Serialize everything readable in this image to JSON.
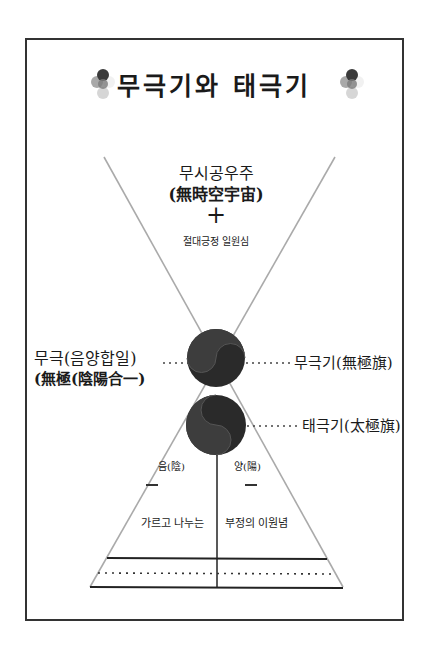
{
  "title": "무극기와 태극기",
  "title_icon": "flower-dots-icon",
  "top_block": {
    "line1": "무시공우주",
    "line2": "(無時空宇宙)",
    "plus": "+",
    "line3": "절대긍정 일원심"
  },
  "left_label": {
    "line1": "무극(음양합일)",
    "line2": "(無極(陰陽合一)"
  },
  "right_labels": {
    "upper": "무극기(無極旗)",
    "lower": "태극기(太極旗)"
  },
  "bottom": {
    "yin": "음(陰)",
    "yang": "양(陽)",
    "dash": "—",
    "left_text": "가르고 나누는",
    "right_text": "부정의 이원념"
  },
  "colors": {
    "frame": "#333333",
    "diag_lines": "#aaaaaa",
    "circle_dark": "#2a2a2a",
    "circle_light": "#4a4a4a"
  }
}
